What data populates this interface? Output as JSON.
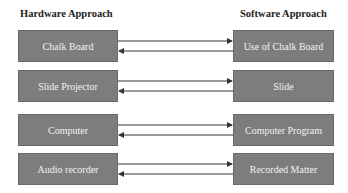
{
  "headings": {
    "left": "Hardware Approach",
    "right": "Software Approach"
  },
  "rows": [
    {
      "hardware": "Chalk Board",
      "software": "Use of Chalk Board",
      "top": 30
    },
    {
      "hardware": "Slide Projector",
      "software": "Slide",
      "top": 70
    },
    {
      "hardware": "Computer",
      "software": "Computer Program",
      "top": 114
    },
    {
      "hardware": "Audio recorder",
      "software": "Recorded Matter",
      "top": 153
    }
  ],
  "colors": {
    "box_fill": "#7d7d7d",
    "box_text": "#f2f2f2",
    "arrow": "#333333"
  }
}
